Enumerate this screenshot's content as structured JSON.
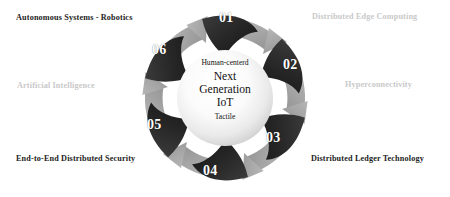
{
  "diagram": {
    "title_center": {
      "top_line": "Human-centerd",
      "main_line_1": "Next",
      "main_line_2": "Generation",
      "main_line_3": "IoT",
      "bottom_line": "Tactile"
    },
    "colors": {
      "petal_dark": "#2b2b2b",
      "arrow_gray": "#a9a9a9",
      "label_dark": "#1d1d1d",
      "label_light": "#c9c9c9",
      "sphere_center": "#ffffff",
      "sphere_edge": "#d2d2d2",
      "background": "#ffffff"
    },
    "segments": [
      {
        "number": "01",
        "label": "Autonomous Systems - Robotics",
        "label_style": "dark",
        "petal_style": "dark"
      },
      {
        "number": "02",
        "label": "Distributed Edge Computing",
        "label_style": "light",
        "petal_style": "gray"
      },
      {
        "number": "03",
        "label": "Hyperconnectivity",
        "label_style": "light",
        "petal_style": "dark"
      },
      {
        "number": "04",
        "label": "Distributed Ledger Technology",
        "label_style": "dark",
        "petal_style": "dark"
      },
      {
        "number": "05",
        "label": "End-to-End Distributed Security",
        "label_style": "dark",
        "petal_style": "gray"
      },
      {
        "number": "06",
        "label": "Artificial Intelligence",
        "label_style": "light",
        "petal_style": "gray"
      }
    ],
    "labels_positioned": [
      {
        "id": "label-0",
        "text": "Autonomous Systems - Robotics",
        "style": "dark",
        "corner": "top-left"
      },
      {
        "id": "label-1",
        "text": "Distributed Edge Computing",
        "style": "light",
        "corner": "top-right"
      },
      {
        "id": "label-2",
        "text": "Hyperconnectivity",
        "style": "light",
        "corner": "middle-right"
      },
      {
        "id": "label-3",
        "text": "Distributed Ledger Technology",
        "style": "dark",
        "corner": "bottom-right"
      },
      {
        "id": "label-4",
        "text": "End-to-End Distributed Security",
        "style": "dark",
        "corner": "bottom-left"
      },
      {
        "id": "label-5",
        "text": "Artificial Intelligence",
        "style": "light",
        "corner": "middle-left"
      }
    ],
    "numbers": [
      "01",
      "02",
      "03",
      "04",
      "05",
      "06"
    ]
  }
}
